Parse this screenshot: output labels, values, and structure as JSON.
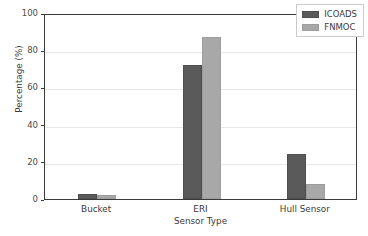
{
  "chart_data": {
    "type": "bar",
    "title": "",
    "xlabel": "Sensor Type",
    "ylabel": "Percentage (%)",
    "categories": [
      "Bucket",
      "ERI",
      "Hull Sensor"
    ],
    "series": [
      {
        "name": "ICOADS",
        "color": "#5a5a5a",
        "values": [
          2.5,
          72,
          24
        ]
      },
      {
        "name": "FNMOC",
        "color": "#a8a8a8",
        "values": [
          2.2,
          87,
          8
        ]
      }
    ],
    "ylim": [
      0,
      100
    ],
    "yticks": [
      0,
      20,
      40,
      60,
      80,
      100
    ],
    "ytick_labels": [
      "0",
      "20",
      "40",
      "60",
      "80",
      "100"
    ],
    "grid": true,
    "grid_axis": "y",
    "legend_position": "upper right",
    "legend_entries": [
      "ICOADS",
      "FNMOC"
    ]
  }
}
